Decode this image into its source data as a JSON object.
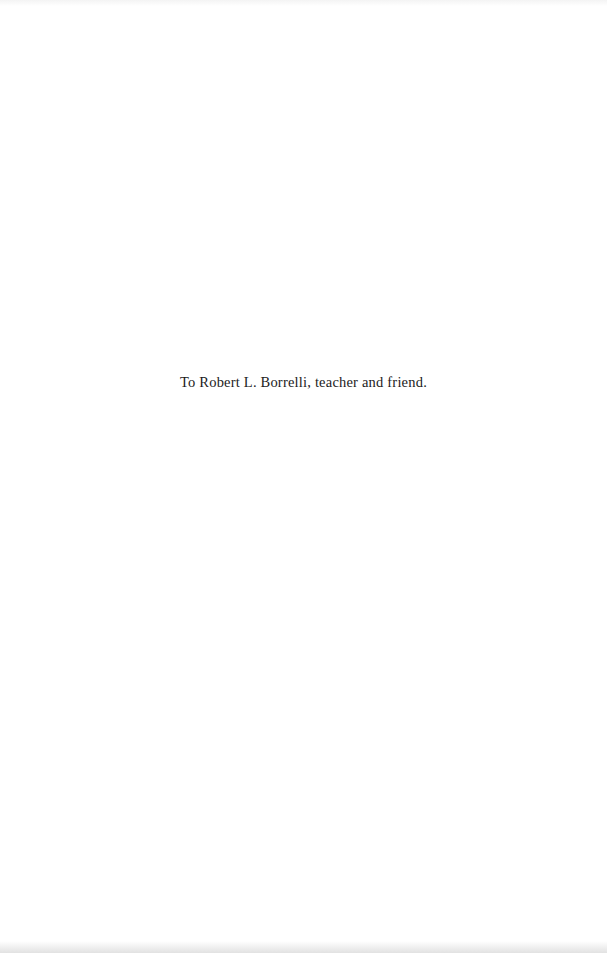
{
  "page": {
    "dedication_text": "To Robert L. Borrelli, teacher and friend."
  }
}
